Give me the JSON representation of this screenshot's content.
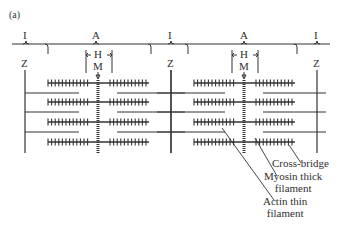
{
  "figure": {
    "panel_label": "(a)",
    "band_labels": [
      {
        "text": "I",
        "x": 26
      },
      {
        "text": "A",
        "x": 96
      },
      {
        "text": "I",
        "x": 171
      },
      {
        "text": "A",
        "x": 244
      },
      {
        "text": "I",
        "x": 317
      }
    ],
    "z_labels": [
      {
        "text": "Z",
        "x": 25
      },
      {
        "text": "Z",
        "x": 171
      },
      {
        "text": "Z",
        "x": 317
      }
    ],
    "h_zone_label": "H",
    "m_line_label": "M",
    "sarcomeres": [
      {
        "z_left": 25,
        "m_center": 98,
        "z_right": 171
      },
      {
        "z_left": 171,
        "m_center": 244,
        "z_right": 317
      }
    ],
    "thick_filament_rows_y": [
      83,
      102,
      122,
      142
    ],
    "thin_filament_rows_y": [
      93,
      112,
      132
    ],
    "callouts": {
      "cross_bridge": "Cross-bridge",
      "myosin_line1": "Myosin thick",
      "myosin_line2": "filament",
      "actin_line1": "Actin thin",
      "actin_line2": "filament"
    },
    "colors": {
      "ink": "#333333",
      "background": "#ffffff"
    }
  }
}
